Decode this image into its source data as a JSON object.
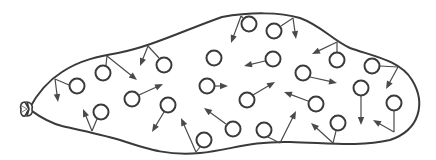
{
  "diagram": {
    "colors": {
      "stroke": "#3a3a3a",
      "arrow": "#4a4a4a",
      "background": "#ffffff"
    },
    "balloon": {
      "outline_path": "M 29 109 C 36 96, 46 82, 62 72 C 80 60, 100 56, 118 53 C 150 47, 185 30, 222 17 C 250 12, 280 12, 300 18 C 322 26, 332 40, 350 48 C 372 56, 400 60, 412 80 C 426 103, 420 130, 390 140 C 360 147, 330 143, 290 142 C 250 141, 230 150, 200 153 C 170 156, 150 150, 120 140 C 100 134, 80 130, 62 126 C 46 122, 36 114, 29 109 Z",
      "knot": {
        "x": 29,
        "y": 109
      }
    },
    "molecules": [
      {
        "cx": 77,
        "cy": 86,
        "tether": [
          69,
          85,
          55,
          79
        ],
        "arrow": [
          55,
          79,
          58,
          102
        ]
      },
      {
        "cx": 103,
        "cy": 73,
        "tether": [
          106,
          65,
          107,
          56
        ],
        "arrow": [
          107,
          56,
          137,
          80
        ]
      },
      {
        "cx": 101,
        "cy": 112,
        "tether": [
          97,
          119,
          92,
          131
        ],
        "arrow": [
          92,
          131,
          83,
          109
        ]
      },
      {
        "cx": 132,
        "cy": 99,
        "tether": null,
        "arrow": [
          139,
          95,
          163,
          84
        ]
      },
      {
        "cx": 164,
        "cy": 65,
        "tether": [
          159,
          58,
          148,
          46
        ],
        "arrow": [
          148,
          46,
          140,
          66
        ]
      },
      {
        "cx": 168,
        "cy": 105,
        "tether": null,
        "arrow": [
          164,
          112,
          152,
          132
        ]
      },
      {
        "cx": 204,
        "cy": 140,
        "tether": [
          200,
          147,
          196,
          152
        ],
        "arrow": [
          196,
          152,
          181,
          118
        ]
      },
      {
        "cx": 207,
        "cy": 86,
        "tether": null,
        "arrow": [
          215,
          86,
          228,
          86
        ]
      },
      {
        "cx": 214,
        "cy": 58,
        "tether": null,
        "arrow": null
      },
      {
        "cx": 249,
        "cy": 24,
        "tether": [
          243,
          18,
          241,
          16
        ],
        "arrow": [
          241,
          16,
          231,
          43
        ]
      },
      {
        "cx": 274,
        "cy": 31,
        "tether": [
          281,
          26,
          293,
          18
        ],
        "arrow": [
          293,
          18,
          296,
          39
        ]
      },
      {
        "cx": 273,
        "cy": 59,
        "tether": null,
        "arrow": [
          265,
          61,
          244,
          66
        ]
      },
      {
        "cx": 247,
        "cy": 100,
        "tether": null,
        "arrow": [
          253,
          95,
          275,
          82
        ]
      },
      {
        "cx": 233,
        "cy": 129,
        "tether": null,
        "arrow": [
          226,
          124,
          204,
          108
        ]
      },
      {
        "cx": 264,
        "cy": 130,
        "tether": [
          268,
          137,
          280,
          143
        ],
        "arrow": [
          280,
          143,
          296,
          111
        ]
      },
      {
        "cx": 303,
        "cy": 73,
        "tether": null,
        "arrow": [
          310,
          77,
          337,
          83
        ]
      },
      {
        "cx": 316,
        "cy": 104,
        "tether": null,
        "arrow": [
          308,
          101,
          284,
          92
        ]
      },
      {
        "cx": 337,
        "cy": 60,
        "tether": [
          337,
          52,
          337,
          42
        ],
        "arrow": [
          337,
          42,
          312,
          54
        ]
      },
      {
        "cx": 338,
        "cy": 123,
        "tether": [
          336,
          131,
          333,
          143
        ],
        "arrow": [
          333,
          143,
          311,
          123
        ]
      },
      {
        "cx": 361,
        "cy": 88,
        "tether": null,
        "arrow": [
          361,
          96,
          361,
          125
        ]
      },
      {
        "cx": 372,
        "cy": 66,
        "tether": [
          380,
          66,
          398,
          67
        ],
        "arrow": [
          398,
          67,
          386,
          89
        ]
      },
      {
        "cx": 394,
        "cy": 103,
        "tether": [
          394,
          111,
          394,
          132
        ],
        "arrow": [
          394,
          132,
          373,
          120
        ]
      }
    ],
    "molecule_radius": 7.5
  }
}
